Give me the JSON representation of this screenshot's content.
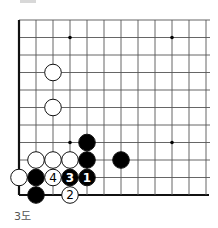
{
  "diagram": {
    "caption": "3도",
    "grid": {
      "cols": 12,
      "rows": 11,
      "x0": 19,
      "y0": 20,
      "dx": 17,
      "dy": 17.5,
      "line_color": "#555555",
      "edge_color": "#111111",
      "thick_edges": [
        "left",
        "bottom"
      ]
    },
    "star_points": [
      {
        "col": 3,
        "row": 1
      },
      {
        "col": 9,
        "row": 1
      },
      {
        "col": 3,
        "row": 7
      },
      {
        "col": 9,
        "row": 7
      }
    ],
    "stones": [
      {
        "color": "white",
        "col": 2,
        "row": 3,
        "label": ""
      },
      {
        "color": "white",
        "col": 2,
        "row": 5,
        "label": ""
      },
      {
        "color": "black",
        "col": 4,
        "row": 7,
        "label": ""
      },
      {
        "color": "white",
        "col": 1,
        "row": 8,
        "label": ""
      },
      {
        "color": "white",
        "col": 2,
        "row": 8,
        "label": ""
      },
      {
        "color": "white",
        "col": 3,
        "row": 8,
        "label": ""
      },
      {
        "color": "black",
        "col": 4,
        "row": 8,
        "label": ""
      },
      {
        "color": "black",
        "col": 6,
        "row": 8,
        "label": ""
      },
      {
        "color": "white",
        "col": 0,
        "row": 9,
        "label": ""
      },
      {
        "color": "black",
        "col": 1,
        "row": 9,
        "label": ""
      },
      {
        "color": "white",
        "col": 2,
        "row": 9,
        "label": "4"
      },
      {
        "color": "black",
        "col": 3,
        "row": 9,
        "label": "3"
      },
      {
        "color": "black",
        "col": 4,
        "row": 9,
        "label": "1"
      },
      {
        "color": "black",
        "col": 1,
        "row": 10,
        "label": ""
      },
      {
        "color": "white",
        "col": 3,
        "row": 10,
        "label": "2"
      }
    ],
    "colors": {
      "black_stone": "#000000",
      "white_stone": "#ffffff",
      "stone_outline": "#111111"
    }
  }
}
